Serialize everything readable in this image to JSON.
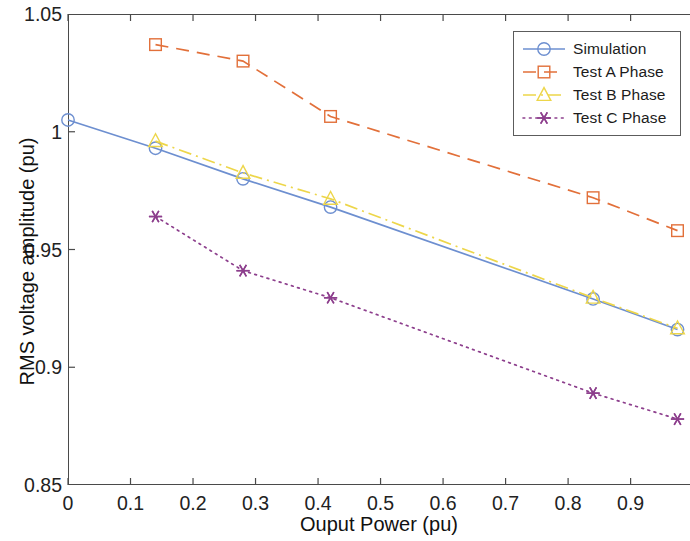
{
  "chart_data": {
    "type": "line",
    "title": "",
    "xlabel": "Ouput Power (pu)",
    "ylabel": "RMS voltage amplitude (pu)",
    "xlim": [
      0,
      0.995
    ],
    "ylim": [
      0.85,
      1.05
    ],
    "xticks": [
      0,
      0.1,
      0.2,
      0.3,
      0.4,
      0.5,
      0.6,
      0.7,
      0.8,
      0.9
    ],
    "xticklabels": [
      "0",
      "0.1",
      "0.2",
      "0.3",
      "0.4",
      "0.5",
      "0.6",
      "0.7",
      "0.8",
      "0.9"
    ],
    "yticks": [
      0.85,
      0.9,
      0.95,
      1,
      1.05
    ],
    "yticklabels": [
      "0.85",
      "0.9",
      "0.95",
      "1",
      "1.05"
    ],
    "grid": false,
    "legend_position": "top-right",
    "series": [
      {
        "name": "Simulation",
        "color": "#6d8fd0",
        "marker": "circle",
        "linestyle": "solid",
        "x": [
          0,
          0.14,
          0.28,
          0.42,
          0.84,
          0.975
        ],
        "y": [
          1.005,
          0.993,
          0.98,
          0.968,
          0.929,
          0.916
        ]
      },
      {
        "name": "Test A Phase",
        "color": "#e2703a",
        "marker": "square",
        "linestyle": "dashed",
        "x": [
          0.14,
          0.28,
          0.42,
          0.84,
          0.975
        ],
        "y": [
          1.037,
          1.03,
          1.0065,
          0.972,
          0.958
        ]
      },
      {
        "name": "Test B Phase",
        "color": "#edd64a",
        "marker": "triangle",
        "linestyle": "dashdot",
        "x": [
          0.14,
          0.28,
          0.42,
          0.84,
          0.975
        ],
        "y": [
          0.996,
          0.9825,
          0.9715,
          0.9295,
          0.9165
        ]
      },
      {
        "name": "Test C Phase",
        "color": "#8d3f8d",
        "marker": "asterisk",
        "linestyle": "dotted",
        "x": [
          0.14,
          0.28,
          0.42,
          0.84,
          0.975
        ],
        "y": [
          0.964,
          0.941,
          0.9295,
          0.889,
          0.878
        ]
      }
    ]
  },
  "legend": {
    "entries": [
      {
        "label": "Simulation"
      },
      {
        "label": "Test A Phase"
      },
      {
        "label": "Test B Phase"
      },
      {
        "label": "Test C Phase"
      }
    ]
  }
}
